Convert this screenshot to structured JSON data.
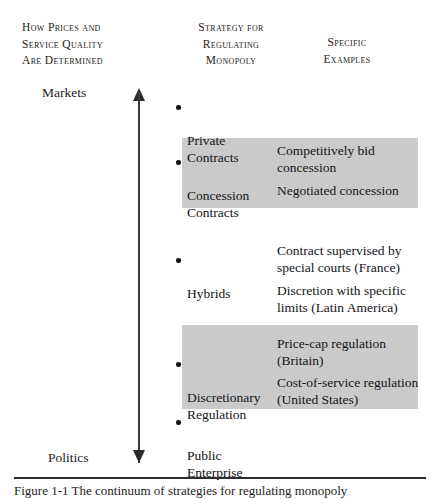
{
  "figure": {
    "headers": [
      {
        "id": "how-prices",
        "text": "How Prices and\nService Quality\nAre Determined"
      },
      {
        "id": "strategy",
        "text": "Strategy for\nRegulating\nMonopoly"
      },
      {
        "id": "specific-examples",
        "text": "Specific\nExamples"
      }
    ],
    "axis": {
      "top_label": "Markets",
      "bottom_label": "Politics",
      "orientation": "vertical-double-arrow"
    },
    "strategies": [
      {
        "id": "private",
        "label": "Private\nContracts",
        "shaded": false
      },
      {
        "id": "concession",
        "label": "Concession\nContracts",
        "shaded": true
      },
      {
        "id": "hybrids",
        "label": "Hybrids",
        "shaded": false
      },
      {
        "id": "discretionary",
        "label": "Discretionary\nRegulation",
        "shaded": true
      },
      {
        "id": "public",
        "label": "Public\nEnterprise",
        "shaded": false
      }
    ],
    "examples": [
      {
        "id": "competitive",
        "text": "Competitively bid\nconcession",
        "shaded": true
      },
      {
        "id": "negotiated",
        "text": "Negotiated concession",
        "shaded": true
      },
      {
        "id": "courts",
        "text": "Contract supervised by\nspecial courts (France)",
        "shaded": false
      },
      {
        "id": "discretion",
        "text": "Discretion with specific\nlimits (Latin America)",
        "shaded": false
      },
      {
        "id": "pricecap",
        "text": "Price-cap regulation\n(Britain)",
        "shaded": true
      },
      {
        "id": "costservice",
        "text": "Cost-of-service regulation\n(United States)",
        "shaded": true
      }
    ],
    "bands": [
      {
        "id": "concession-band",
        "color": "#cacaca"
      },
      {
        "id": "discretionary-band",
        "color": "#cacaca"
      }
    ],
    "caption": "Figure 1-1 The continuum of strategies for regulating monopoly"
  }
}
